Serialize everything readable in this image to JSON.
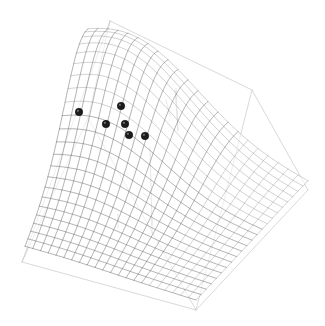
{
  "figure": {
    "type": "3d-surface-scatter",
    "width": 325,
    "height": 326,
    "background_color": "#ffffff",
    "title": "",
    "has_axis_labels": false,
    "has_tick_labels": false,
    "has_legend": false,
    "has_gridlines": false
  },
  "chart_data": {
    "type": "line",
    "subtype": "3d-wireframe-surface-with-scatter",
    "title": "",
    "xlabel": "",
    "ylabel": "",
    "zlabel": "",
    "grid": false,
    "legend_position": "none",
    "xlim": [
      0,
      1
    ],
    "ylim": [
      0,
      1
    ],
    "zlim": [
      0,
      1
    ],
    "surface": {
      "name": "fitted-surface",
      "nx": 22,
      "ny": 22,
      "color": "#555555",
      "z_grid_note": "saddle/ridge surface rising toward the far-left-back region and falling toward front and right",
      "peak_at": [
        0.22,
        0.86
      ],
      "peak_value": 0.92,
      "min_value": 0.0
    },
    "scatter": {
      "name": "observed-points",
      "marker": "filled-circle",
      "color": "#1c1c1c",
      "size": 7.5,
      "count": 6,
      "points_screen": [
        {
          "id": "p1",
          "x": 79,
          "y": 112
        },
        {
          "id": "p2",
          "x": 121,
          "y": 106
        },
        {
          "id": "p3",
          "x": 106,
          "y": 124
        },
        {
          "id": "p4",
          "x": 125,
          "y": 124
        },
        {
          "id": "p5",
          "x": 129,
          "y": 135
        },
        {
          "id": "p6",
          "x": 145,
          "y": 136
        }
      ]
    },
    "bounding_box": {
      "color": "#c9c9c9",
      "corners_screen": {
        "top": [
          110,
          21
        ],
        "upper_right": [
          252,
          90
        ],
        "right": [
          308,
          190
        ],
        "bottom": [
          196,
          310
        ],
        "lower_left": [
          22,
          262
        ],
        "left_back": [
          88,
          118
        ]
      }
    },
    "axis_ticks": {
      "color": "#b5b5b5",
      "count": 6,
      "ticks_screen": [
        {
          "x": 118,
          "y1": 214,
          "x2": 118,
          "y2": 228
        },
        {
          "x": 152,
          "y1": 219,
          "x2": 152,
          "y2": 234
        },
        {
          "x": 175,
          "y1": 90,
          "x2": 178,
          "y2": 130
        },
        {
          "x": 205,
          "y1": 185,
          "x2": 212,
          "y2": 191
        },
        {
          "x": 166,
          "y1": 100,
          "x2": 170,
          "y2": 116
        },
        {
          "x": 143,
          "y1": 193,
          "x2": 150,
          "y2": 199
        }
      ]
    }
  }
}
